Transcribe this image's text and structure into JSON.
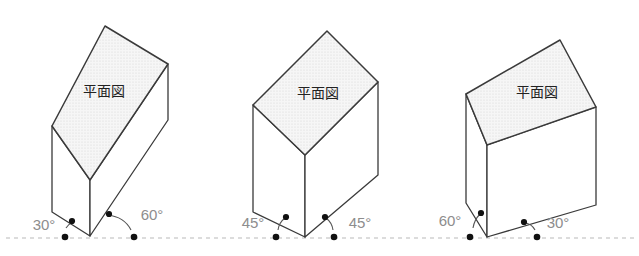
{
  "figure": {
    "title": "",
    "background_color": "#ffffff",
    "baseline": {
      "name": "ground-line",
      "style": "dashed",
      "color": "#b9b9b9",
      "y": 238,
      "x_start": 6,
      "x_end": 634
    },
    "face_fill_color": "#f2f2f2",
    "edge_color": "#3a3a3a",
    "label_color": "#222222",
    "angle_label_color": "#888888",
    "marker_color": "#111111",
    "arc_color": "#555555",
    "plan_view_label": "平面図",
    "degree_symbol": "°",
    "blocks": [
      {
        "id": "block-1",
        "name": "prism-left",
        "plan_label": "平面図",
        "left_angle": "30°",
        "right_angle": "60°",
        "left_angle_value": 30,
        "right_angle_value": 60,
        "top_face": "105,26 168,64 52,126 Z",
        "top_face_poly": "105,26 168,64 90,180 52,126",
        "front_face_poly": "52,126 90,180 90,236 52,212",
        "right_face_poly": "90,180 168,64 168,120 90,236",
        "label_x": 105,
        "label_y": 92
      },
      {
        "id": "block-2",
        "name": "prism-center",
        "plan_label": "平面図",
        "left_angle": "45°",
        "right_angle": "45°",
        "left_angle_value": 45,
        "right_angle_value": 45,
        "top_face_poly": "327,31 378,82 305,155 253,105",
        "front_face_poly": "253,105 305,155 305,237 253,212",
        "right_face_poly": "305,155 378,82 378,175 305,237",
        "label_x": 318,
        "label_y": 95
      },
      {
        "id": "block-3",
        "name": "prism-right",
        "plan_label": "平面図",
        "left_angle": "60°",
        "right_angle": "30°",
        "left_angle_value": 60,
        "right_angle_value": 30,
        "top_face_poly": "560,40 596,107 487,145 466,94",
        "front_face_poly": "466,94 487,145 487,237 466,203",
        "right_face_poly": "487,145 596,107 596,205 487,237",
        "label_x": 535,
        "label_y": 95
      }
    ],
    "markers": [
      {
        "name": "baseline-dot-1a",
        "x": 65,
        "y": 237
      },
      {
        "name": "edge-dot-1a",
        "x": 72,
        "y": 222
      },
      {
        "name": "baseline-dot-1b",
        "x": 114,
        "y": 237
      },
      {
        "name": "edge-dot-1b",
        "x": 107,
        "y": 215
      },
      {
        "name": "baseline-dot-2a",
        "x": 277,
        "y": 237
      },
      {
        "name": "edge-dot-2a",
        "x": 283,
        "y": 218
      },
      {
        "name": "baseline-dot-2b",
        "x": 332,
        "y": 237
      },
      {
        "name": "edge-dot-2b",
        "x": 326,
        "y": 218
      },
      {
        "name": "baseline-dot-3a",
        "x": 471,
        "y": 237
      },
      {
        "name": "edge-dot-3a",
        "x": 479,
        "y": 215
      },
      {
        "name": "baseline-dot-3b",
        "x": 530,
        "y": 237
      },
      {
        "name": "edge-dot-3b",
        "x": 523,
        "y": 223
      }
    ],
    "angle_labels": [
      {
        "name": "angle-label-30-left",
        "text": "30°",
        "x": 44,
        "y": 228,
        "anchor": "middle"
      },
      {
        "name": "angle-label-60-right",
        "text": "60°",
        "x": 143,
        "y": 218,
        "anchor": "middle"
      },
      {
        "name": "angle-label-45-left",
        "text": "45°",
        "x": 257,
        "y": 230,
        "anchor": "middle"
      },
      {
        "name": "angle-label-45-right",
        "text": "45°",
        "x": 352,
        "y": 230,
        "anchor": "middle"
      },
      {
        "name": "angle-label-60-left",
        "text": "60°",
        "x": 450,
        "y": 224,
        "anchor": "middle"
      },
      {
        "name": "angle-label-30-right",
        "text": "30°",
        "x": 551,
        "y": 228,
        "anchor": "middle"
      }
    ]
  }
}
